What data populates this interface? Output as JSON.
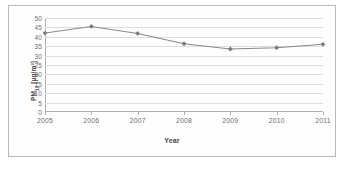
{
  "chart_data": {
    "type": "line",
    "title": "",
    "xlabel": "Year",
    "ylabel": "PM10 [µg/m³]",
    "ylabel_base": "PM",
    "ylabel_sub": "10",
    "ylabel_unit": "[µg/m³]",
    "categories": [
      "2005",
      "2006",
      "2007",
      "2008",
      "2009",
      "2010",
      "2011"
    ],
    "values": [
      42.0,
      45.5,
      41.8,
      36.3,
      33.5,
      34.2,
      36.0
    ],
    "series": [
      {
        "name": "PM10",
        "values": [
          42.0,
          45.5,
          41.8,
          36.3,
          33.5,
          34.2,
          36.0
        ]
      }
    ],
    "ylim": [
      0,
      50
    ],
    "yticks": [
      0,
      5,
      10,
      15,
      20,
      25,
      30,
      35,
      40,
      45,
      50
    ],
    "ytick_labels": [
      "0",
      "5",
      "10",
      "15",
      "20",
      "25",
      "30",
      "35",
      "40",
      "45",
      "50"
    ],
    "xtick_labels": [
      "2005",
      "2006",
      "2007",
      "2008",
      "2009",
      "2010",
      "2011"
    ],
    "grid": true,
    "grid_axis": "y",
    "legend": false,
    "legend_position": "none",
    "marker": "diamond",
    "line_color": "#8a8a8a",
    "marker_color": "#7a7a7a",
    "grid_color": "#dddddd",
    "axis_color": "#b0b0b0",
    "text_color": "#6e6e6e",
    "background": "#ffffff",
    "frame_border_color": "#b9b9b9"
  }
}
